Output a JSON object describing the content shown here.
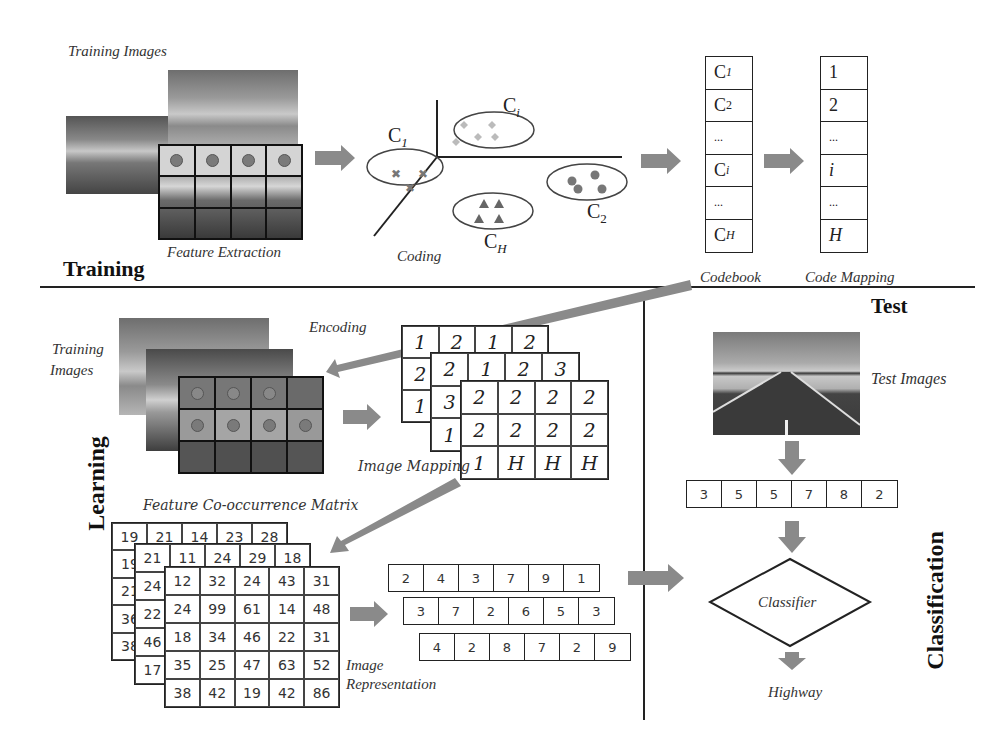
{
  "training": {
    "section_label": "Training",
    "training_images_label": "Training Images",
    "feature_extraction_label": "Feature Extraction",
    "coding_label": "Coding",
    "codebook_label": "Codebook",
    "code_mapping_label": "Code Mapping",
    "clusters": [
      {
        "label": "C",
        "sub": "1",
        "marker": "cross"
      },
      {
        "label": "C",
        "sub": "i",
        "marker": "diamond"
      },
      {
        "label": "C",
        "sub": "2",
        "marker": "circle"
      },
      {
        "label": "C",
        "sub": "H",
        "marker": "triangle"
      }
    ],
    "codebook": [
      "C1",
      "C2",
      "...",
      "Ci",
      "...",
      "CH"
    ],
    "codebook_display": [
      {
        "main": "C",
        "sub": "1"
      },
      {
        "main": "C",
        "sub": "2"
      },
      {
        "main": "...",
        "sub": ""
      },
      {
        "main": "C",
        "sub": "i"
      },
      {
        "main": "...",
        "sub": ""
      },
      {
        "main": "C",
        "sub": "H"
      }
    ],
    "code_mapping": [
      "1",
      "2",
      "...",
      "i",
      "...",
      "H"
    ]
  },
  "learning": {
    "section_label": "Learning",
    "training_images_label_line1": "Training",
    "training_images_label_line2": "Images",
    "encoding_label": "Encoding",
    "image_mapping_label": "Image Mapping",
    "feature_cooccurrence_label": "Feature Co-occurrence Matrix",
    "image_representation_label_line1": "Image",
    "image_representation_label_line2": "Representation",
    "image_mapping_layers": [
      [
        [
          "1",
          "2",
          "1",
          "2"
        ],
        [
          "2",
          "",
          ""
        ],
        [
          "1",
          "",
          ""
        ]
      ],
      [
        [
          "2",
          "1",
          "2",
          "3"
        ],
        [
          "3"
        ],
        [
          "1"
        ]
      ],
      [
        [
          "2",
          "2",
          "2",
          "2"
        ],
        [
          "2",
          "2",
          "2",
          "2"
        ],
        [
          "1",
          "H",
          "H",
          "H"
        ]
      ]
    ],
    "mapping_back": {
      "row1": [
        "1",
        "2",
        "1",
        "2"
      ],
      "col": [
        "2",
        "1"
      ]
    },
    "mapping_mid": {
      "row1": [
        "2",
        "1",
        "2",
        "3"
      ],
      "col": [
        "3",
        "1"
      ]
    },
    "mapping_front": [
      [
        "2",
        "2",
        "2",
        "2"
      ],
      [
        "2",
        "2",
        "2",
        "2"
      ],
      [
        "1",
        "H",
        "H",
        "H"
      ]
    ],
    "cooccurrence_back": {
      "row1": [
        "19",
        "21",
        "14",
        "23",
        "28"
      ],
      "col": [
        "19",
        "21",
        "36",
        "38"
      ]
    },
    "cooccurrence_mid": {
      "row1": [
        "21",
        "11",
        "24",
        "29",
        "18"
      ],
      "col": [
        "24",
        "22",
        "46",
        "17"
      ]
    },
    "cooccurrence_front": [
      [
        "12",
        "32",
        "24",
        "43",
        "31"
      ],
      [
        "24",
        "99",
        "61",
        "14",
        "48"
      ],
      [
        "18",
        "34",
        "46",
        "22",
        "31"
      ],
      [
        "35",
        "25",
        "47",
        "63",
        "52"
      ],
      [
        "38",
        "42",
        "19",
        "42",
        "86"
      ]
    ],
    "representations": [
      [
        "2",
        "4",
        "3",
        "7",
        "9",
        "1"
      ],
      [
        "3",
        "7",
        "2",
        "6",
        "5",
        "3"
      ],
      [
        "4",
        "2",
        "8",
        "7",
        "2",
        "9"
      ]
    ]
  },
  "test": {
    "section_label": "Test",
    "test_images_label": "Test Images",
    "test_vector": [
      "3",
      "5",
      "5",
      "7",
      "8",
      "2"
    ],
    "classifier_label": "Classifier",
    "result_label": "Highway"
  },
  "classification": {
    "section_label": "Classification"
  },
  "colors": {
    "arrow": "#8a8a8a",
    "line": "#222222",
    "marker": "#7a7a7a",
    "diamond_marker": "#b5b5b5"
  }
}
